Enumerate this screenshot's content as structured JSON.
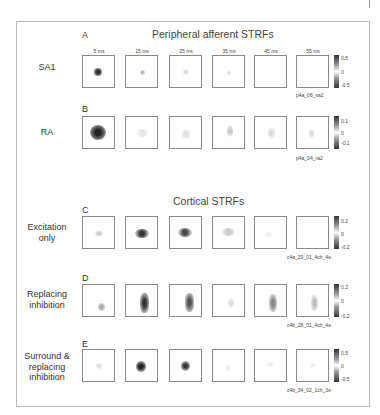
{
  "sections": [
    {
      "title": "Peripheral afferent STRFs"
    },
    {
      "title": "Cortical STRFs"
    }
  ],
  "time_labels": [
    "5 ms",
    "15 ms",
    "25 ms",
    "35 ms",
    "45 ms",
    "55 ms"
  ],
  "rows": [
    {
      "letter": "A",
      "label": "SA1",
      "cell_id": "p4a_06_sa2",
      "colorbar": [
        "0.5",
        "0",
        "-0.5"
      ]
    },
    {
      "letter": "B",
      "label": "RA",
      "cell_id": "p4a_04_ra2",
      "colorbar": [
        "0.1",
        "0",
        "-0.1"
      ]
    },
    {
      "letter": "C",
      "label": "Excitation only",
      "label_lines": [
        "Excitation",
        "only"
      ],
      "cell_id": "c4a_20_01_4ch_4e",
      "colorbar": [
        "0.2",
        "0",
        "-0.2"
      ]
    },
    {
      "letter": "D",
      "label": "Replacing inhibition",
      "label_lines": [
        "Replacing",
        "inhibition"
      ],
      "cell_id": "c4b_28_01_4ch_4e",
      "colorbar": [
        "0.2",
        "0",
        "-0.2"
      ]
    },
    {
      "letter": "E",
      "label": "Surround & replacing inhibition",
      "label_lines": [
        "Surround &",
        "replacing",
        "inhibition"
      ],
      "cell_id": "c4b_34_02_1ch_3e",
      "colorbar": [
        "0.5",
        "0",
        "-0.5"
      ]
    }
  ]
}
